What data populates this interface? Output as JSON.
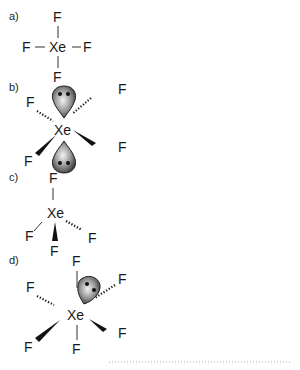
{
  "panels": [
    {
      "label": "a)",
      "center": "Xe",
      "ligands": [
        "F",
        "F",
        "F",
        "F"
      ],
      "lone_pairs": 0,
      "geometry": "square planar (2D sketch)"
    },
    {
      "label": "b)",
      "center": "Xe",
      "ligands": [
        "F",
        "F",
        "F",
        "F"
      ],
      "lone_pairs": 2,
      "geometry": "square planar with axial lone pairs"
    },
    {
      "label": "c)",
      "center": "Xe",
      "ligands": [
        "F",
        "F",
        "F",
        "F"
      ],
      "lone_pairs": 0,
      "geometry": "tetrahedral"
    },
    {
      "label": "d)",
      "center": "Xe",
      "ligands": [
        "F",
        "F",
        "F",
        "F",
        "F",
        "F"
      ],
      "lone_pairs": 1,
      "geometry": "octahedral-like with one lone pair"
    }
  ],
  "colors": {
    "text": "#1a1a1a",
    "lobe_dark": "#3a3a3a",
    "lobe_light": "#f0f0f0",
    "answer_line": "#aaaaaa"
  }
}
